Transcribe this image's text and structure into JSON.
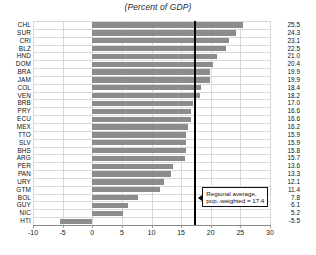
{
  "chart_data": {
    "type": "bar",
    "orientation": "horizontal",
    "title": "(Percent of GDP)",
    "xlabel": "",
    "ylabel": "",
    "xlim": [
      -10,
      30
    ],
    "xticks": [
      -10,
      -5,
      0,
      5,
      10,
      15,
      20,
      25,
      30
    ],
    "grid": true,
    "legend": null,
    "bar_color": "#8c8c8c",
    "categories": [
      "CHL",
      "SUR",
      "CRI",
      "BLZ",
      "HND",
      "DOM",
      "BRA",
      "JAM",
      "COL",
      "VEN",
      "BRB",
      "PRY",
      "ECU",
      "MEX",
      "TTO",
      "SLV",
      "BHS",
      "ARG",
      "PER",
      "PAN",
      "URY",
      "GTM",
      "BOL",
      "GUY",
      "NIC",
      "HTI"
    ],
    "values": [
      25.5,
      24.3,
      23.1,
      22.5,
      21.0,
      20.4,
      19.9,
      19.9,
      18.4,
      18.2,
      17.0,
      16.6,
      16.6,
      16.2,
      15.9,
      15.9,
      15.8,
      15.7,
      13.6,
      13.3,
      12.1,
      11.4,
      7.8,
      6.1,
      5.2,
      -5.5
    ],
    "annotations": [
      {
        "name": "regional-average",
        "line1": "Regional average,",
        "line2": "pop.-weighted = 17.4",
        "value": 17.4
      }
    ]
  }
}
